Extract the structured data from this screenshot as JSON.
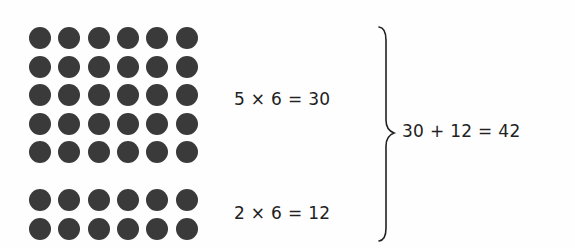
{
  "figure": {
    "background": "#ffffff",
    "dot_color": "#3a3a3a",
    "top_group": {
      "rows": 5,
      "cols": 6,
      "equation": "5 × 6 = 30"
    },
    "bottom_group": {
      "rows": 2,
      "cols": 6,
      "equation": "2 × 6 = 12"
    },
    "brace_icon": "right-curly-brace",
    "total_equation": "30 + 12 = 42"
  }
}
